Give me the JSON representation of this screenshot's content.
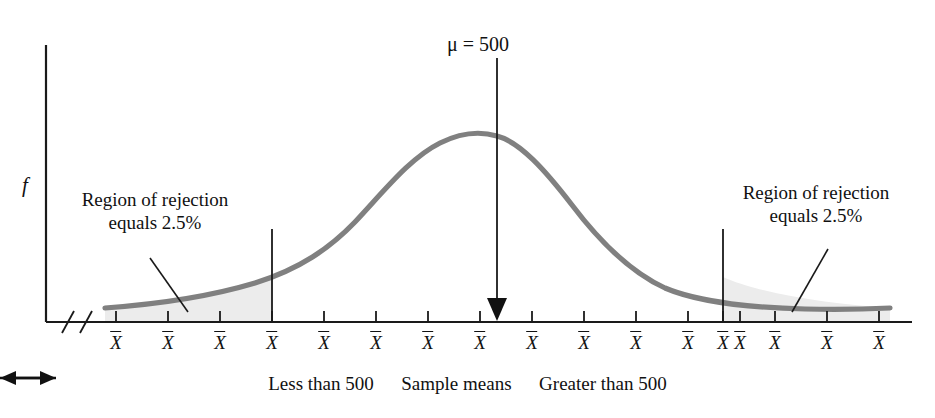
{
  "figure": {
    "type": "sampling-distribution-two-tailed-rejection-regions",
    "axis": {
      "y_axis_label": "f",
      "x_tick_label": "X̅",
      "x_tick_count": 17,
      "axis_break_marks": 2
    },
    "annotations": {
      "mu": "μ = 500",
      "rejection_left_line1": "Region of rejection",
      "rejection_left_line2": "equals 2.5%",
      "rejection_right_line1": "Region of rejection",
      "rejection_right_line2": "equals 2.5%"
    },
    "caption": {
      "left_text": "Less than 500",
      "left_arrow": "←",
      "center_text": "Sample means",
      "right_arrow": "→",
      "right_text": "Greater than 500"
    },
    "colors": {
      "curve": "#808080",
      "axis": "#1a1a1a",
      "shading": "#ececec",
      "text": "#111111",
      "arrowhead": "#111111"
    }
  },
  "chart_data": {
    "type": "line",
    "title": "",
    "subtitle": "",
    "xlabel": "Sample means",
    "ylabel": "f",
    "distribution": "normal",
    "mean": 500,
    "peak_x_index": 8,
    "alpha_total": 0.05,
    "alpha_per_tail": 0.025,
    "rejection_region_left_percent": "2.5%",
    "rejection_region_right_percent": "2.5%",
    "critical_tick_left_index": 3,
    "critical_tick_right_index": 13,
    "grid": false,
    "legend": false,
    "x_tick_labels": [
      "X̅",
      "X̅",
      "X̅",
      "X̅",
      "X̅",
      "X̅",
      "X̅",
      "X̅",
      "X̅",
      "X̅",
      "X̅",
      "X̅",
      "X̅",
      "X̅",
      "X̅",
      "X̅",
      "X̅"
    ],
    "curve_y_values": [
      0.02,
      0.03,
      0.06,
      0.12,
      0.26,
      0.47,
      0.71,
      0.91,
      1.0,
      0.91,
      0.71,
      0.47,
      0.26,
      0.12,
      0.06,
      0.03,
      0.02
    ]
  }
}
